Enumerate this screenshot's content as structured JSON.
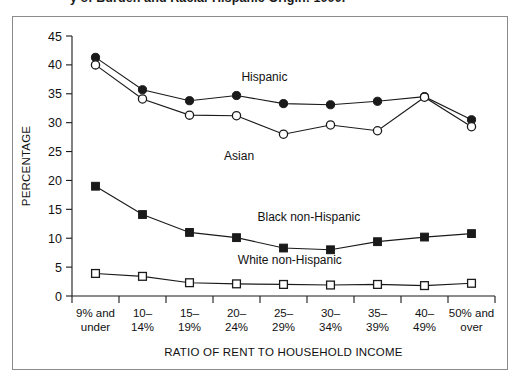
{
  "caption": {
    "clipped_text": "y of Burden and Racial-Hispanic Origin: 1990."
  },
  "chart_data": {
    "type": "line",
    "title": "",
    "xlabel": "RATIO OF RENT TO HOUSEHOLD INCOME",
    "ylabel": "PERCENTAGE",
    "ylim": [
      0,
      45
    ],
    "yticks": [
      0,
      5,
      10,
      15,
      20,
      25,
      30,
      35,
      40,
      45
    ],
    "grid": false,
    "legend": "inline-annotations",
    "categories": [
      "9% and under",
      "10–14%",
      "15–19%",
      "20–24%",
      "25–29%",
      "30–34%",
      "35–39%",
      "40–49%",
      "50% and over"
    ],
    "category_lines": [
      [
        "9% and",
        "under"
      ],
      [
        "10–",
        "14%"
      ],
      [
        "15–",
        "19%"
      ],
      [
        "20–",
        "24%"
      ],
      [
        "25–",
        "29%"
      ],
      [
        "30–",
        "34%"
      ],
      [
        "35–",
        "39%"
      ],
      [
        "40–",
        "49%"
      ],
      [
        "50% and",
        "over"
      ]
    ],
    "series": [
      {
        "name": "Hispanic",
        "marker": "filled-circle",
        "values": [
          41.3,
          35.7,
          33.8,
          34.7,
          33.3,
          33.1,
          33.7,
          34.5,
          30.5
        ]
      },
      {
        "name": "Asian",
        "marker": "open-circle",
        "values": [
          40.0,
          34.1,
          31.3,
          31.2,
          28.0,
          29.6,
          28.6,
          34.4,
          29.3
        ]
      },
      {
        "name": "Black non-Hispanic",
        "marker": "filled-square",
        "values": [
          19.0,
          14.1,
          11.0,
          10.1,
          8.3,
          8.0,
          9.4,
          10.2,
          10.8
        ]
      },
      {
        "name": "White non-Hispanic",
        "marker": "open-square",
        "values": [
          3.9,
          3.4,
          2.3,
          2.1,
          2.0,
          1.9,
          2.0,
          1.8,
          2.2
        ]
      }
    ],
    "annotations": [
      {
        "label": "Hispanic",
        "x_frac": 0.455,
        "y_value": 37.2
      },
      {
        "label": "Asian",
        "x_frac": 0.395,
        "y_value": 23.6
      },
      {
        "label": "Black non-Hispanic",
        "x_frac": 0.56,
        "y_value": 12.9
      },
      {
        "label": "White non-Hispanic",
        "x_frac": 0.515,
        "y_value": 5.6
      }
    ],
    "colors": {
      "line": "#1a1a1a",
      "marker_fill": "#1a1a1a",
      "marker_open_fill": "#ffffff",
      "background": "#ffffff",
      "frame": "#8b8b8b"
    }
  }
}
